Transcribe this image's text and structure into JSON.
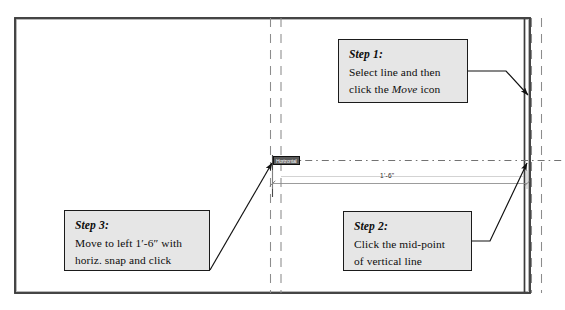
{
  "drawing": {
    "title": "Move line with horizontal snap",
    "dimension_label": "1'-6\"",
    "snap_tooltip": "Horizontal",
    "colors": {
      "outline": "#3a3a3a",
      "grid_dashed": "#8c8c8c",
      "centerline": "#4a4a4a",
      "dimension": "#6e6e6e",
      "leader": "#111111",
      "callout_fill": "#e6e6e6",
      "callout_border": "#1b1b1b"
    }
  },
  "callouts": [
    {
      "id": "step1",
      "heading": "Step 1:",
      "line1": "Select line and then",
      "line2_pre": "click the ",
      "line2_em": "Move",
      "line2_post": " icon"
    },
    {
      "id": "step2",
      "heading": "Step 2:",
      "line1": "Click the mid-point",
      "line2_pre": "of vertical line",
      "line2_em": "",
      "line2_post": ""
    },
    {
      "id": "step3",
      "heading": "Step 3:",
      "line1": "Move to left 1′-6″ with",
      "line2_pre": "horiz. snap and click",
      "line2_em": "",
      "line2_post": ""
    }
  ]
}
